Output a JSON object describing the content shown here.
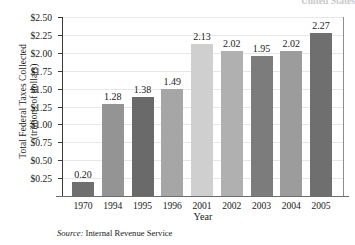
{
  "figure": {
    "title_fragment": "United States",
    "xlabel": "Year",
    "ylabel_line1": "Total Federal Taxes Collected",
    "ylabel_line2": "(trillions of dollars)",
    "source_word": "Source:",
    "source_text": "Internal Revenue Service"
  },
  "chart_data": {
    "type": "bar",
    "title": "United States",
    "xlabel": "Year",
    "ylabel": "Total Federal Taxes Collected (trillions of dollars)",
    "categories": [
      "1970",
      "1994",
      "1995",
      "1996",
      "2001",
      "2002",
      "2003",
      "2004",
      "2005"
    ],
    "values": [
      0.2,
      1.28,
      1.38,
      1.49,
      2.13,
      2.02,
      1.95,
      2.02,
      2.27
    ],
    "value_labels": [
      "0.20",
      "1.28",
      "1.38",
      "1.49",
      "2.13",
      "2.02",
      "1.95",
      "2.02",
      "2.27"
    ],
    "bar_colors": [
      "#6f6f6f",
      "#949494",
      "#6a6a6a",
      "#a6a6a6",
      "#cfcfcf",
      "#b0b0b0",
      "#7c7c7c",
      "#9c9c9c",
      "#6f6f6f"
    ],
    "ylim": [
      0.0,
      2.5
    ],
    "ytick_values": [
      2.5,
      2.25,
      2.0,
      1.75,
      1.5,
      1.25,
      1.0,
      0.75,
      0.5,
      0.25
    ],
    "ytick_labels": [
      "$2.50",
      "$2.25",
      "$2.00",
      "$1.75",
      "$1.50",
      "$1.25",
      "$1.00",
      "$0.75",
      "$0.50",
      "$0.25"
    ],
    "grid": true,
    "legend": null,
    "source": "Source: Internal Revenue Service"
  }
}
